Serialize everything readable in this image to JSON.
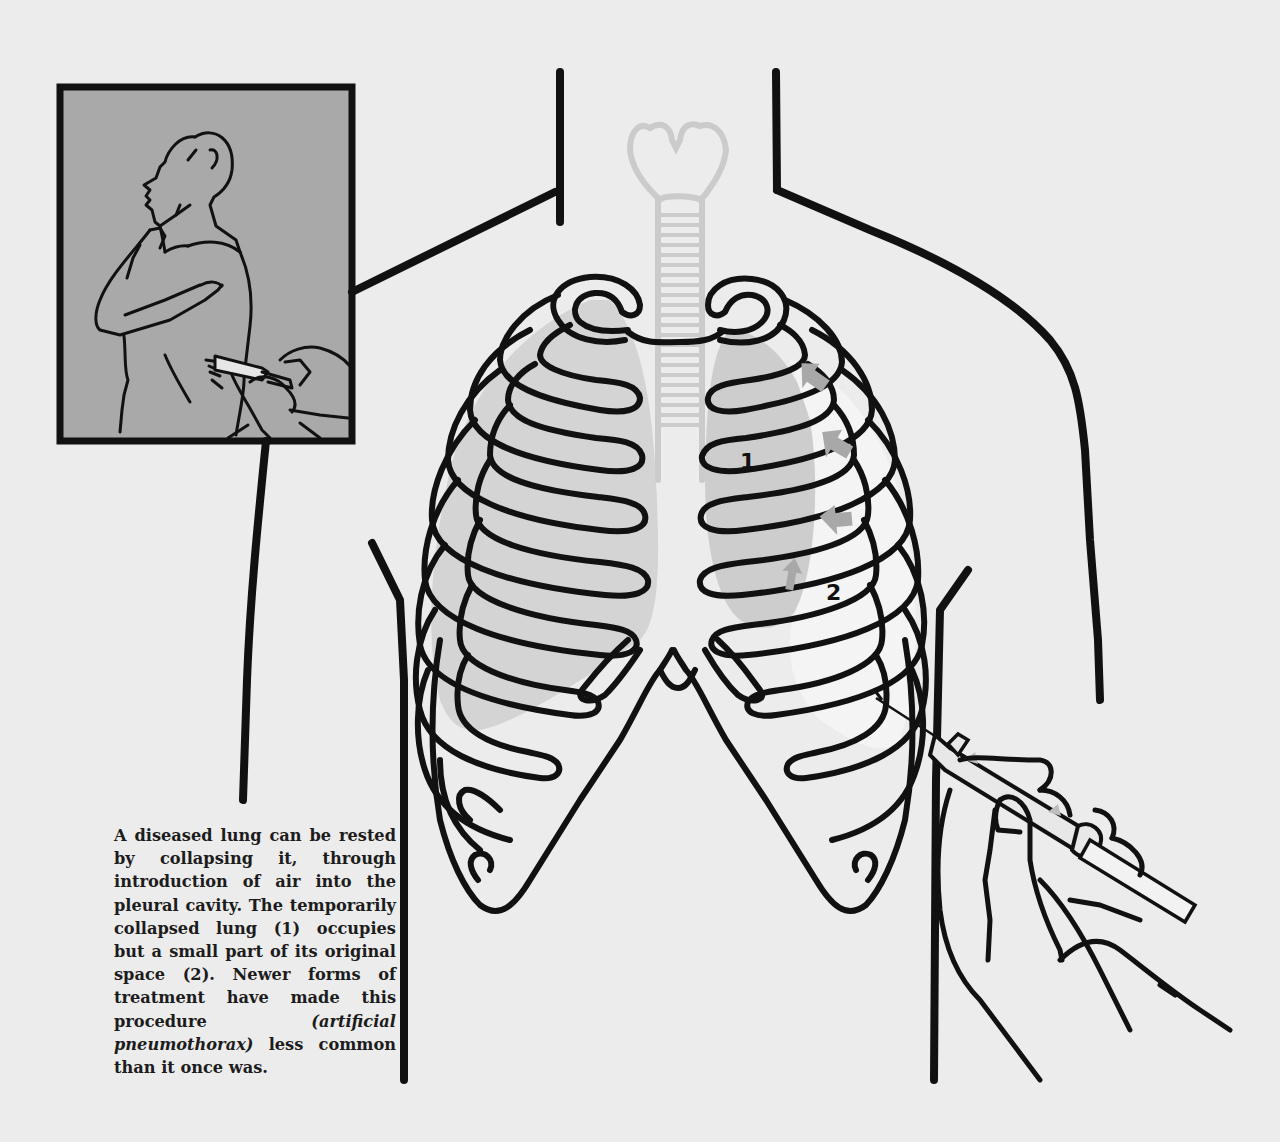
{
  "figure": {
    "inset": {
      "description": "Seated patient in profile receiving needle in side of chest",
      "background_color": "#a9a9a9"
    },
    "labels": {
      "collapsed_lung": "1",
      "original_space": "2"
    },
    "colors": {
      "background": "#ececec",
      "outline": "#111111",
      "lung_fill": "#d2d2d2",
      "trachea_ghost": "#cfcfcf",
      "arrow": "#a8a8a8"
    }
  },
  "caption": {
    "part1": "A diseased lung can be rested by collapsing it, through introduction of air into the pleural cavity. The temporarily collapsed lung (1) occupies but a small part of its original space (2). Newer forms of treatment have made this procedure ",
    "emphasis": "(artificial pneumothorax)",
    "part2": " less common than it once was."
  }
}
